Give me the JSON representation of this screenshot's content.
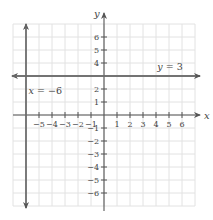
{
  "chart_data": {
    "type": "line",
    "title": "",
    "xlabel": "x",
    "ylabel": "y",
    "xlim": [
      -7,
      7
    ],
    "ylim": [
      -7,
      7
    ],
    "grid": true,
    "x_ticks": [
      -5,
      -4,
      -3,
      -2,
      -1,
      1,
      2,
      3,
      4,
      5,
      6
    ],
    "y_ticks": [
      -6,
      -5,
      -4,
      -3,
      -2,
      -1,
      1,
      2,
      4,
      5,
      6
    ],
    "series": [
      {
        "name": "y = 3",
        "kind": "horizontal",
        "equation_var": "y",
        "equation_rest": " = 3",
        "value": 3,
        "label_position": {
          "x": 4.1,
          "y": 3.45
        }
      },
      {
        "name": "x = −6",
        "kind": "vertical",
        "equation_var": "x",
        "equation_rest": " = −6",
        "value": -6,
        "label_position": {
          "x": -5.8,
          "y": 1.6
        }
      }
    ],
    "colors": {
      "grid": "#e2e2e2",
      "axis": "#555555",
      "lines": "#6b6b6b",
      "text": "#444444"
    }
  },
  "layout": {
    "origin_px": [
      104,
      115
    ],
    "unit_px": 13
  }
}
